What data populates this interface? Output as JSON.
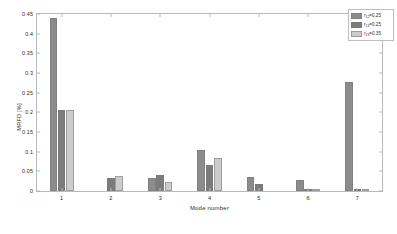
{
  "chart_data": {
    "type": "bar",
    "title": "",
    "xlabel": "Mode number",
    "ylabel": "MRFD [%]",
    "categories": [
      "1",
      "2",
      "3",
      "4",
      "5",
      "6",
      "7"
    ],
    "ylim": [
      0,
      0.45
    ],
    "yticks": [
      "0",
      "0.05",
      "0.1",
      "0.15",
      "0.2",
      "0.25",
      "0.3",
      "0.35",
      "0.4",
      "0.45"
    ],
    "ytick_values": [
      0,
      0.05,
      0.1,
      0.15,
      0.2,
      0.25,
      0.3,
      0.35,
      0.4,
      0.45
    ],
    "grid": false,
    "legend_position": "top-right",
    "series": [
      {
        "name": "r12=0.25",
        "label_base": "r",
        "label_sub": "12",
        "label_rest": "=0.25",
        "color": "#8c8c8c",
        "values": [
          0.441,
          0.0,
          0.034,
          0.105,
          0.035,
          0.029,
          0.276
        ]
      },
      {
        "name": "r13=0.25",
        "label_base": "r",
        "label_sub": "13",
        "label_rest": "=0.25",
        "color": "#7c7c7c",
        "values": [
          0.207,
          0.032,
          0.04,
          0.067,
          0.018,
          0.005,
          0.004
        ]
      },
      {
        "name": "r23=0.35",
        "label_base": "r",
        "label_sub": "23",
        "label_rest": "=0.35",
        "color": "#cccccc",
        "values": [
          0.207,
          0.038,
          0.024,
          0.083,
          0.0,
          0.005,
          0.003
        ]
      }
    ]
  }
}
